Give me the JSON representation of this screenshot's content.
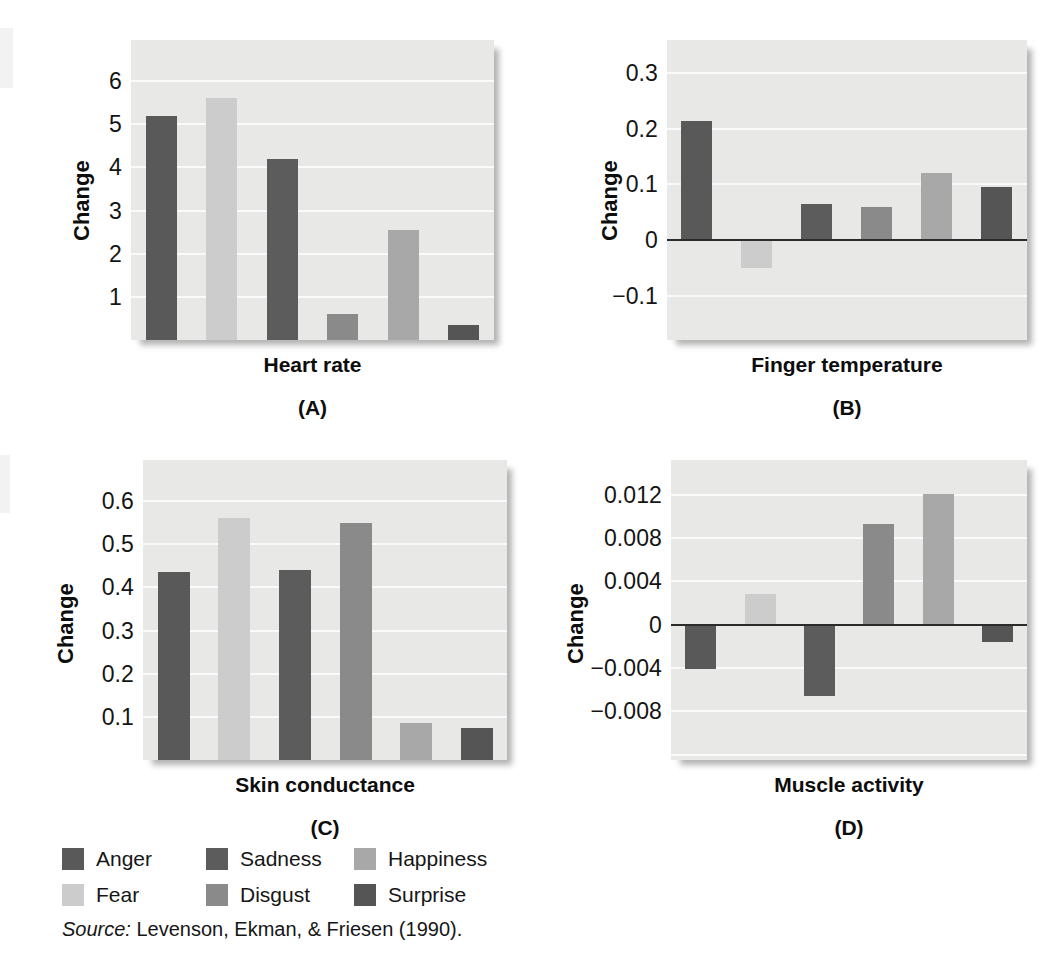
{
  "figure": {
    "series_names": [
      "Anger",
      "Fear",
      "Sadness",
      "Disgust",
      "Happiness",
      "Surprise"
    ],
    "series_colors": {
      "Anger": "#595959",
      "Fear": "#cccccc",
      "Sadness": "#5c5c5c",
      "Disgust": "#8a8a8a",
      "Happiness": "#a8a8a8",
      "Surprise": "#555555"
    },
    "plot_background": "#e8e8e6",
    "gridline_color": "#fafafa",
    "zeroline_color": "#2b2b2b"
  },
  "legend": {
    "rows": [
      [
        {
          "label": "Anger",
          "color": "#595959"
        },
        {
          "label": "Sadness",
          "color": "#5c5c5c"
        },
        {
          "label": "Happiness",
          "color": "#a8a8a8"
        }
      ],
      [
        {
          "label": "Fear",
          "color": "#cccccc"
        },
        {
          "label": "Disgust",
          "color": "#8a8a8a"
        },
        {
          "label": "Surprise",
          "color": "#555555"
        }
      ]
    ]
  },
  "source": {
    "prefix": "Source:",
    "text": "Levenson, Ekman, & Friesen (1990)."
  },
  "chart_data": [
    {
      "id": "A",
      "type": "bar",
      "title": "Heart rate",
      "panel_label": "(A)",
      "xlabel": "Heart rate",
      "ylabel": "Change",
      "categories": [
        "Anger",
        "Fear",
        "Sadness",
        "Disgust",
        "Happiness",
        "Surprise"
      ],
      "values": [
        5.2,
        5.6,
        4.2,
        0.6,
        2.55,
        0.35
      ],
      "yticks": [
        1,
        2,
        3,
        4,
        5,
        6
      ],
      "yticklabels": [
        "1",
        "2",
        "3",
        "4",
        "5",
        "6"
      ],
      "ylim": [
        0,
        6.95
      ],
      "grid": true,
      "zeroline": false,
      "legend_position": "below-figure"
    },
    {
      "id": "B",
      "type": "bar",
      "title": "Finger temperature",
      "panel_label": "(B)",
      "xlabel": "Finger temperature",
      "ylabel": "Change",
      "categories": [
        "Anger",
        "Fear",
        "Sadness",
        "Disgust",
        "Happiness",
        "Surprise"
      ],
      "values": [
        0.215,
        -0.05,
        0.065,
        0.06,
        0.12,
        0.095
      ],
      "yticks": [
        -0.1,
        0,
        0.1,
        0.2,
        0.3
      ],
      "yticklabels": [
        "−0.1",
        "0",
        "0.1",
        "0.2",
        "0.3"
      ],
      "ylim": [
        -0.18,
        0.36
      ],
      "grid": true,
      "zeroline": true,
      "legend_position": "below-figure"
    },
    {
      "id": "C",
      "type": "bar",
      "title": "Skin conductance",
      "panel_label": "(C)",
      "xlabel": "Skin conductance",
      "ylabel": "Change",
      "categories": [
        "Anger",
        "Fear",
        "Sadness",
        "Disgust",
        "Happiness",
        "Surprise"
      ],
      "values": [
        0.435,
        0.56,
        0.44,
        0.548,
        0.085,
        0.075
      ],
      "yticks": [
        0.1,
        0.2,
        0.3,
        0.4,
        0.5,
        0.6
      ],
      "yticklabels": [
        "0.1",
        "0.2",
        "0.3",
        "0.4",
        "0.5",
        "0.6"
      ],
      "ylim": [
        0,
        0.695
      ],
      "grid": true,
      "zeroline": false,
      "legend_position": "below-figure"
    },
    {
      "id": "D",
      "type": "bar",
      "title": "Muscle activity",
      "panel_label": "(D)",
      "xlabel": "Muscle activity",
      "ylabel": "Change",
      "categories": [
        "Anger",
        "Fear",
        "Sadness",
        "Disgust",
        "Happiness",
        "Surprise"
      ],
      "values": [
        -0.0041,
        0.0028,
        -0.0066,
        0.0093,
        0.0121,
        -0.0016
      ],
      "yticks": [
        -0.008,
        -0.004,
        0,
        0.004,
        0.008,
        0.012
      ],
      "yticklabels": [
        "−0.008",
        "−0.004",
        "0",
        "0.004",
        "0.008",
        "0.012"
      ],
      "ylim": [
        -0.0125,
        0.0152
      ],
      "grid": true,
      "zeroline": true,
      "legend_position": "below-figure"
    }
  ]
}
